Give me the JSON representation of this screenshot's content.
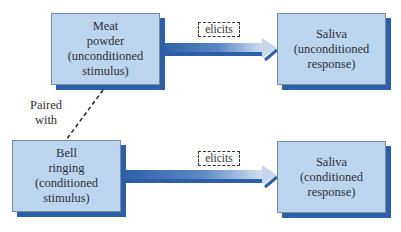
{
  "diagram": {
    "nodes": [
      {
        "id": "meat",
        "label": "Meat\npowder\n(unconditioned\nstimulus)"
      },
      {
        "id": "saliva_ur",
        "label": "Saliva\n(unconditioned\nresponse)"
      },
      {
        "id": "bell",
        "label": "Bell\nringing\n(conditioned\nstimulus)"
      },
      {
        "id": "saliva_cr",
        "label": "Saliva\n(conditioned\nresponse)"
      }
    ],
    "edges": [
      {
        "from": "meat",
        "to": "saliva_ur",
        "label": "elicits"
      },
      {
        "from": "bell",
        "to": "saliva_cr",
        "label": "elicits"
      },
      {
        "from": "meat",
        "to": "bell",
        "label": "Paired\nwith",
        "style": "dashed"
      }
    ],
    "colors": {
      "box_fill": "#bcd5ee",
      "box_shadow": "#2c5fa8",
      "arrow_dark": "#2c5fa8",
      "arrow_light": "#c9d9ec"
    }
  }
}
